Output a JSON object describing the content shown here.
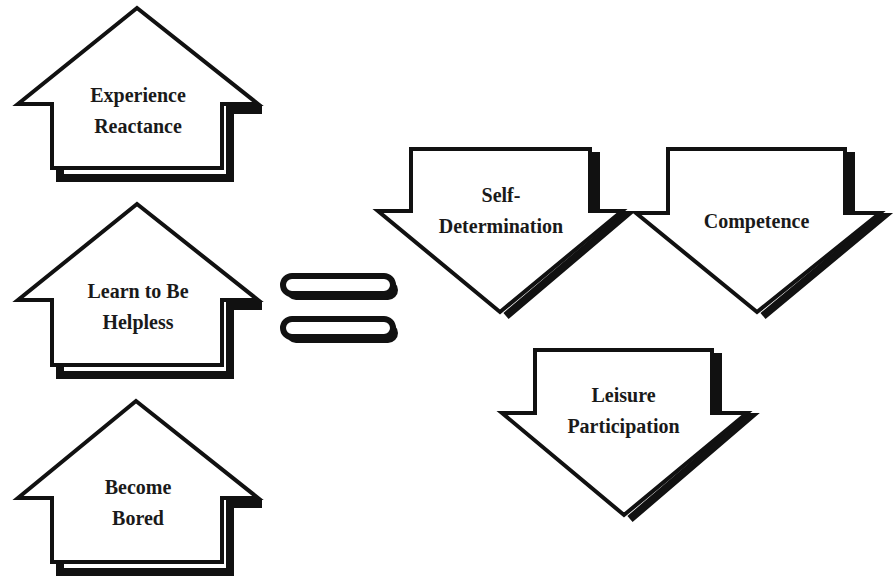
{
  "diagram": {
    "colors": {
      "stroke": "#111111",
      "fill": "#ffffff",
      "text": "#1a1a1a"
    },
    "left_column": {
      "arrow_direction": "up",
      "items": [
        {
          "line1": "Experience",
          "line2": "Reactance"
        },
        {
          "line1": "Learn to Be",
          "line2": "Helpless"
        },
        {
          "line1": "Become",
          "line2": "Bored"
        }
      ]
    },
    "connector": {
      "symbol": "equals"
    },
    "right_group": {
      "arrow_direction": "down",
      "items": [
        {
          "line1": "Self-",
          "line2": "Determination"
        },
        {
          "line1": "Competence",
          "line2": ""
        },
        {
          "line1": "Leisure",
          "line2": "Participation"
        }
      ]
    }
  }
}
